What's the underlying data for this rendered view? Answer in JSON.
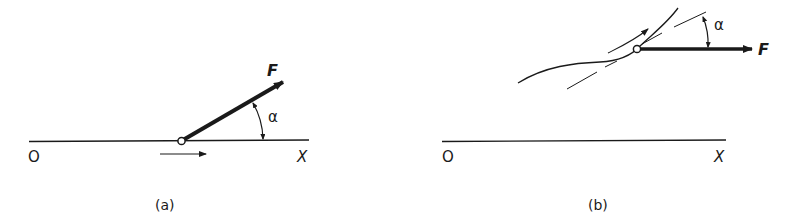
{
  "figure": {
    "panels": [
      {
        "id": "a",
        "caption": "(a)",
        "axis": {
          "origin_label": "O",
          "end_label": "X"
        },
        "force_label": "F",
        "angle_label": "α",
        "description": "Force F applied at a point moving along straight axis OX, at angle α to the direction of motion"
      },
      {
        "id": "b",
        "caption": "(b)",
        "axis": {
          "origin_label": "O",
          "end_label": "X"
        },
        "force_label": "F",
        "angle_label": "α",
        "description": "Force F (parallel to OX) applied at a point moving along a curved path, at angle α to the tangent"
      }
    ]
  },
  "colors": {
    "ink": "#1a1a1a",
    "background": "#ffffff"
  }
}
